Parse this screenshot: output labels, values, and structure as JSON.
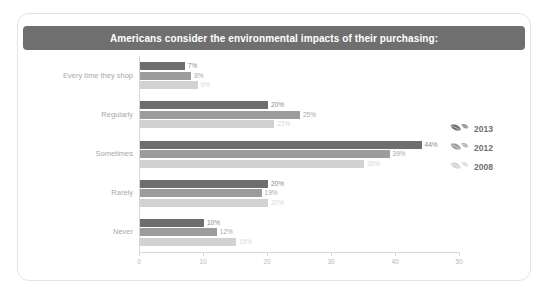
{
  "card": {
    "title": "Americans consider the environmental impacts of their purchasing:"
  },
  "legend": {
    "items": [
      {
        "label": "2013",
        "color": "#6e6e6e",
        "icon": "leaf-icon"
      },
      {
        "label": "2012",
        "color": "#9c9c9c",
        "icon": "leaf-icon"
      },
      {
        "label": "2008",
        "color": "#d2d2d2",
        "icon": "leaf-icon"
      }
    ]
  },
  "chart_data": {
    "type": "bar",
    "orientation": "horizontal",
    "title": "Americans consider the environmental impacts of their purchasing:",
    "xlabel": "",
    "ylabel": "",
    "xlim": [
      0,
      50
    ],
    "xticks": [
      "0",
      "10",
      "20",
      "30",
      "40",
      "50"
    ],
    "grid": false,
    "legend_position": "right",
    "categories": [
      "Every time they shop",
      "Regularly",
      "Sometimes",
      "Rarely",
      "Never"
    ],
    "series": [
      {
        "name": "2013",
        "color": "#6e6e6e",
        "label_color": "#8a8a8a",
        "values": [
          7,
          20,
          44,
          20,
          10
        ],
        "labels": [
          "7%",
          "20%",
          "44%",
          "20%",
          "10%"
        ]
      },
      {
        "name": "2012",
        "color": "#9c9c9c",
        "label_color": "#a8a8a8",
        "values": [
          8,
          25,
          39,
          19,
          12
        ],
        "labels": [
          "8%",
          "25%",
          "39%",
          "19%",
          "12%"
        ]
      },
      {
        "name": "2008",
        "color": "#d2d2d2",
        "label_color": "#d8d8d8",
        "values": [
          9,
          21,
          35,
          20,
          15
        ],
        "labels": [
          "9%",
          "21%",
          "35%",
          "20%",
          "15%"
        ]
      }
    ]
  }
}
